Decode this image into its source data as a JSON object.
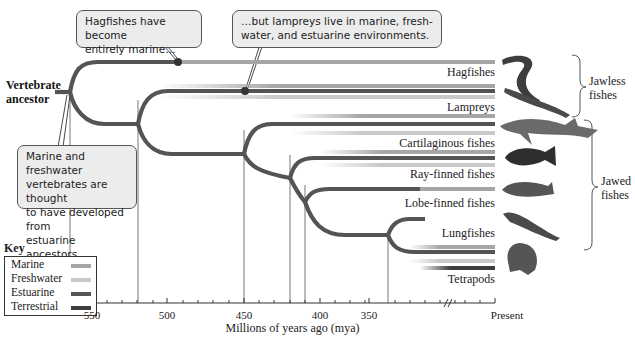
{
  "colors": {
    "marine": "#a6a6a6",
    "freshwater": "#c9c9c9",
    "estuarine": "#555555",
    "terrestrial": "#3e3e3e",
    "callout_fill": "#ececec",
    "branch": "#545454"
  },
  "root": {
    "label_line1": "Vertebrate",
    "label_line2": "ancestor"
  },
  "callouts": [
    {
      "id": "hagfish-note",
      "line1": "Hagfishes have become",
      "line2": "entirely marine…"
    },
    {
      "id": "lamprey-note",
      "line1": "…but lampreys live in marine, fresh-",
      "line2": "water, and estuarine environments."
    },
    {
      "id": "ancestor-note",
      "line1": "Marine and freshwater",
      "line2": "vertebrates are thought",
      "line3": "to have developed from",
      "line4": "estuarine ancestors."
    }
  ],
  "taxa": [
    {
      "name": "Hagfishes",
      "habitats": [
        "marine"
      ],
      "image": "hagfish"
    },
    {
      "name": "Lampreys",
      "habitats": [
        "marine",
        "estuarine",
        "freshwater"
      ],
      "image": "lamprey"
    },
    {
      "name": "Cartilaginous fishes",
      "habitats": [
        "marine",
        "estuarine",
        "freshwater"
      ],
      "image": "shark"
    },
    {
      "name": "Ray-finned fishes",
      "habitats": [
        "marine",
        "estuarine",
        "freshwater"
      ],
      "image": "perch"
    },
    {
      "name": "Lobe-finned fishes",
      "habitats": [
        "marine"
      ],
      "image": "coelacanth"
    },
    {
      "name": "Lungfishes",
      "habitats": [
        "freshwater"
      ],
      "image": "lungfish"
    },
    {
      "name": "Tetrapods",
      "habitats": [
        "marine",
        "estuarine",
        "freshwater",
        "terrestrial"
      ],
      "image": "frog"
    }
  ],
  "groups": [
    {
      "line1": "Jawless",
      "line2": "fishes"
    },
    {
      "line1": "Jawed",
      "line2": "fishes"
    }
  ],
  "key": {
    "title": "Key",
    "items": [
      {
        "label": "Marine",
        "color": "#a6a6a6"
      },
      {
        "label": "Freshwater",
        "color": "#c9c9c9"
      },
      {
        "label": "Estuarine",
        "color": "#555555"
      },
      {
        "label": "Terrestrial",
        "color": "#3e3e3e"
      }
    ]
  },
  "axis": {
    "title": "Millions of years ago (mya)",
    "ticks": [
      "550",
      "500",
      "450",
      "400",
      "350",
      "Present"
    ],
    "divergence_mya": [
      560,
      520,
      450,
      420,
      410,
      355
    ]
  }
}
